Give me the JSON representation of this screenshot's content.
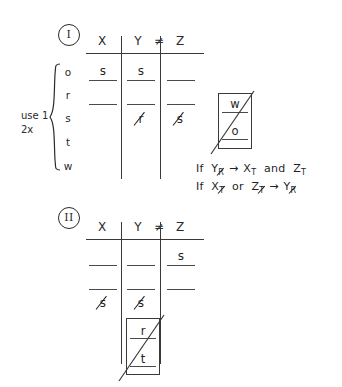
{
  "page": {
    "ink_color": "#1f1f1f",
    "background_color": "#ffffff"
  },
  "sections": [
    {
      "id": "section-1",
      "marker": "I",
      "headers": {
        "col1": "X",
        "col2": "Y",
        "relation": "≠",
        "col3": "Z"
      },
      "row_labels": [
        "o",
        "r",
        "s",
        "t",
        "w"
      ],
      "side_note": "use 1\n2x",
      "cells": [
        {
          "row": 0,
          "col": "X",
          "value": "s",
          "struck": false
        },
        {
          "row": 0,
          "col": "Y",
          "value": "s",
          "struck": false
        },
        {
          "row": 0,
          "col": "Z",
          "value": "",
          "struck": false
        },
        {
          "row": 1,
          "col": "X",
          "value": "",
          "struck": false
        },
        {
          "row": 1,
          "col": "Y",
          "value": "",
          "struck": false
        },
        {
          "row": 1,
          "col": "Z",
          "value": "",
          "struck": false
        },
        {
          "row": 2,
          "col": "X",
          "value": "",
          "struck": false
        },
        {
          "row": 2,
          "col": "Y",
          "value": "r",
          "struck": true
        },
        {
          "row": 2,
          "col": "Z",
          "value": "s",
          "struck": true
        }
      ]
    },
    {
      "id": "section-2",
      "marker": "II",
      "headers": {
        "col1": "X",
        "col2": "Y",
        "relation": "≠",
        "col3": "Z"
      },
      "cells": [
        {
          "row": 0,
          "col": "X",
          "value": "",
          "struck": false
        },
        {
          "row": 0,
          "col": "Y",
          "value": "",
          "struck": false
        },
        {
          "row": 0,
          "col": "Z",
          "value": "s",
          "struck": false
        },
        {
          "row": 1,
          "col": "X",
          "value": "",
          "struck": false
        },
        {
          "row": 1,
          "col": "Y",
          "value": "",
          "struck": false
        },
        {
          "row": 1,
          "col": "Z",
          "value": "",
          "struck": false
        },
        {
          "row": 2,
          "col": "X",
          "value": "s",
          "struck": true
        },
        {
          "row": 2,
          "col": "Y",
          "value": "s",
          "struck": true
        }
      ],
      "inner_box": {
        "top_letter": "r",
        "bottom_letter": "t",
        "has_diagonal": true
      }
    }
  ],
  "side_box": {
    "top_letter": "w",
    "bottom_letter": "o",
    "has_diagonal": true
  },
  "conditions": [
    {
      "id": "condition-1",
      "prefix": "If",
      "antecedent": {
        "base": "Y",
        "sub": "R",
        "sub_struck": true
      },
      "arrow": "→",
      "consequent_1": {
        "base": "X",
        "sub": "T",
        "sub_struck": false
      },
      "conjunction": "and",
      "consequent_2": {
        "base": "Z",
        "sub": "T",
        "sub_struck": false
      },
      "text": "If Y_R → X_T and Z_T"
    },
    {
      "id": "condition-2",
      "prefix": "If",
      "antecedent_1": {
        "base": "X",
        "sub": "T",
        "sub_struck": true
      },
      "conjunction": "or",
      "antecedent_2": {
        "base": "Z",
        "sub": "T",
        "sub_struck": true
      },
      "arrow": "→",
      "consequent": {
        "base": "Y",
        "sub": "R",
        "sub_struck": true
      },
      "text": "If X_T or Z_T → Y_R"
    }
  ]
}
